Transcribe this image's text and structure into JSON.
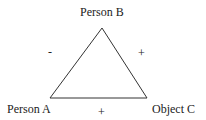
{
  "diagram": {
    "type": "balance-triangle",
    "nodes": {
      "top": {
        "label": "Person B"
      },
      "left": {
        "label": "Person A"
      },
      "right": {
        "label": "Object C"
      }
    },
    "edges": {
      "left_top": {
        "sign": "-"
      },
      "top_right": {
        "sign": "+"
      },
      "left_right": {
        "sign": "+"
      }
    },
    "colors": {
      "line": "#333333",
      "text": "#222222",
      "background": "#ffffff"
    }
  }
}
